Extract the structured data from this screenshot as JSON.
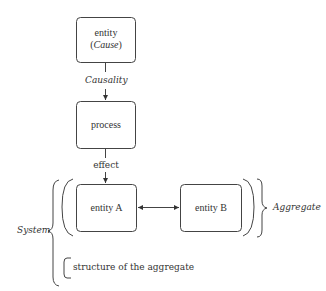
{
  "diagram": {
    "nodes": {
      "cause": {
        "line1": "entity",
        "line2_open": "(",
        "line2_italic": "Cause",
        "line2_close": ")"
      },
      "process": {
        "label": "process"
      },
      "entity_a": {
        "label": "entity A"
      },
      "entity_b": {
        "label": "entity B"
      }
    },
    "edges": {
      "causality": {
        "label": "Causality"
      },
      "effect": {
        "label": "effect"
      },
      "a_b": {
        "label": ""
      }
    },
    "groups": {
      "aggregate": {
        "label": "Aggregate"
      },
      "system": {
        "label": "System"
      },
      "structure": {
        "label": "structure of the aggregate"
      }
    },
    "colors": {
      "stroke": "#444444",
      "text": "#333333",
      "background": "#ffffff"
    }
  }
}
